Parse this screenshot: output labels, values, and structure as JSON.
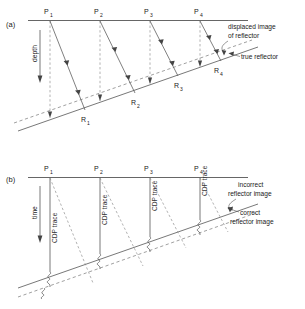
{
  "figure": {
    "panels": [
      {
        "id": "(a)",
        "axis_label": "depth",
        "surface_points": [
          "P",
          "P",
          "P",
          "P"
        ],
        "surface_point_subs": [
          "1",
          "2",
          "3",
          "4"
        ],
        "reflector_points": [
          "R",
          "R",
          "R",
          "R"
        ],
        "reflector_point_subs": [
          "1",
          "2",
          "3",
          "4"
        ],
        "annotations": [
          {
            "line1": "displaced image",
            "line2": "of reflector"
          },
          {
            "line1": "true reflector",
            "line2": ""
          }
        ]
      },
      {
        "id": "(b)",
        "axis_label": "time",
        "surface_points": [
          "P",
          "P",
          "P",
          "P"
        ],
        "surface_point_subs": [
          "1",
          "2",
          "3",
          "4"
        ],
        "trace_label": "CDP trace",
        "annotations": [
          {
            "line1": "incorrect",
            "line2": "reflector  image"
          },
          {
            "line1": "correct",
            "line2": "reflector  image"
          }
        ]
      }
    ],
    "colors": {
      "ink": "#1a1a1a",
      "line": "#555555",
      "dashed": "#777777",
      "surface": "#666666",
      "background": "#ffffff"
    }
  }
}
